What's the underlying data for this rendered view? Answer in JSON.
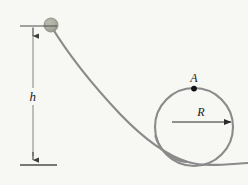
{
  "figure": {
    "type": "physics-diagram",
    "background_color": "#f7f7f4",
    "width": 248,
    "height": 185
  },
  "labels": {
    "height_label": "h",
    "point_label": "A",
    "radius_label": "R"
  },
  "colors": {
    "track": "#8a8a8a",
    "loop": "#8a8a8a",
    "ball_fill": "#a9a99d",
    "ball_stroke": "#8f8f84",
    "dimension_line": "#4d4d4d",
    "point_marker": "#111111",
    "text": "#1a1a1a"
  },
  "geometry": {
    "ball": {
      "cx": 51,
      "cy": 25,
      "r": 7
    },
    "loop": {
      "cx": 194,
      "cy": 127,
      "r": 39
    },
    "point_A": {
      "x": 194,
      "y": 89
    },
    "radius_arrow": {
      "x1": 172,
      "y1": 122,
      "x2": 232,
      "y2": 122
    },
    "height_dimension": {
      "x": 33,
      "y_top": 26,
      "y_bottom": 165
    },
    "top_tick": {
      "x1": 20,
      "x2": 57,
      "y": 26
    },
    "baseline": {
      "x1": 20,
      "x2": 57,
      "y": 165
    },
    "track_path": "M 51 26 C 62 44, 86 78, 120 114 C 146 141, 168 156, 188 162 C 205 167, 222 165, 248 163",
    "loop_entry_path": "M 156 140 C 162 152, 172 160, 188 162"
  }
}
